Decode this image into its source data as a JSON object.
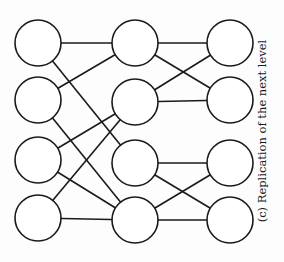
{
  "caption": "(c) Replication of the next level",
  "style": {
    "stroke": "#1a1a1a",
    "fill": "#ffffff",
    "node_radius": 23,
    "stroke_width": 1.6
  },
  "nodes": [
    {
      "id": "L1",
      "x": 38,
      "y": 43
    },
    {
      "id": "L2",
      "x": 38,
      "y": 100
    },
    {
      "id": "L3",
      "x": 38,
      "y": 160
    },
    {
      "id": "L4",
      "x": 38,
      "y": 218
    },
    {
      "id": "M1",
      "x": 135,
      "y": 43
    },
    {
      "id": "M2",
      "x": 135,
      "y": 102
    },
    {
      "id": "M3",
      "x": 135,
      "y": 163
    },
    {
      "id": "M4",
      "x": 135,
      "y": 220
    },
    {
      "id": "R1",
      "x": 230,
      "y": 43
    },
    {
      "id": "R2",
      "x": 230,
      "y": 100
    },
    {
      "id": "R3",
      "x": 230,
      "y": 163
    },
    {
      "id": "R4",
      "x": 230,
      "y": 220
    }
  ],
  "edges": [
    [
      "L1",
      "M1"
    ],
    [
      "L1",
      "M3"
    ],
    [
      "L2",
      "M1"
    ],
    [
      "L2",
      "M4"
    ],
    [
      "L3",
      "M2"
    ],
    [
      "L3",
      "M4"
    ],
    [
      "L4",
      "M2"
    ],
    [
      "L4",
      "M4"
    ],
    [
      "M1",
      "R1"
    ],
    [
      "M1",
      "R2"
    ],
    [
      "M2",
      "R1"
    ],
    [
      "M2",
      "R2"
    ],
    [
      "M3",
      "R3"
    ],
    [
      "M3",
      "R4"
    ],
    [
      "M4",
      "R3"
    ],
    [
      "M4",
      "R4"
    ]
  ]
}
